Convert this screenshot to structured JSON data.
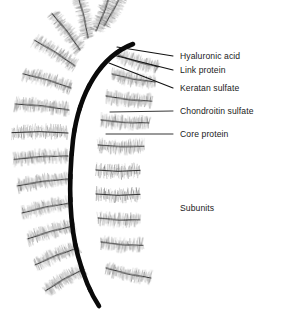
{
  "figure": {
    "width": 282,
    "height": 321,
    "background_color": "#ffffff"
  },
  "colors": {
    "backbone": "#0a0a0a",
    "core_protein": "#2b2b2b",
    "bristle_light": "#b9b9b9",
    "bristle_mid": "#8c8c8c",
    "bristle_dark": "#5a5a5a",
    "leader_line": "#111111",
    "text": "#1a1a1a"
  },
  "labels": [
    {
      "id": "hyaluronic-acid",
      "text": "Hyaluronic acid",
      "x": 180,
      "y": 51,
      "leader": {
        "x1": 173,
        "y1": 56,
        "x2": 117,
        "y2": 47
      }
    },
    {
      "id": "link-protein",
      "text": "Link protein",
      "x": 180,
      "y": 65,
      "leader": {
        "x1": 173,
        "y1": 70,
        "x2": 113,
        "y2": 55
      }
    },
    {
      "id": "keratan-sulfate",
      "text": "Keratan sulfate",
      "x": 180,
      "y": 83,
      "leader": {
        "x1": 173,
        "y1": 88,
        "x2": 109,
        "y2": 63
      }
    },
    {
      "id": "chondroitin-sulfate",
      "text": "Chondroitin sulfate",
      "x": 180,
      "y": 106,
      "leader": {
        "x1": 173,
        "y1": 111,
        "x2": 110,
        "y2": 112
      }
    },
    {
      "id": "core-protein",
      "text": "Core protein",
      "x": 180,
      "y": 129,
      "leader": {
        "x1": 173,
        "y1": 134,
        "x2": 106,
        "y2": 134
      }
    }
  ],
  "annotations": [
    {
      "id": "subunits",
      "text": "Subunits",
      "x": 180,
      "y": 203
    }
  ],
  "structure": {
    "backbone_name": "hyaluronic-acid-backbone",
    "backbone_path": "M 133 44 C 101 56, 79 92, 73 140 C 68 186, 70 226, 78 256 C 85 282, 93 297, 99 306",
    "backbone_width": 4.6,
    "link_protein_count": 12,
    "subunit_count": 21,
    "subunits": [
      {
        "x": 104,
        "y": 26,
        "len": 46,
        "angle": -63,
        "side": "upper"
      },
      {
        "x": 96,
        "y": 31,
        "len": 44,
        "angle": -70,
        "side": "upper"
      },
      {
        "x": 88,
        "y": 38,
        "len": 44,
        "angle": -104,
        "side": "upper"
      },
      {
        "x": 80,
        "y": 50,
        "len": 46,
        "angle": -128,
        "side": "left"
      },
      {
        "x": 75,
        "y": 66,
        "len": 48,
        "angle": -148,
        "side": "left"
      },
      {
        "x": 71,
        "y": 88,
        "len": 50,
        "angle": -164,
        "side": "left"
      },
      {
        "x": 69,
        "y": 110,
        "len": 54,
        "angle": -174,
        "side": "left"
      },
      {
        "x": 68,
        "y": 133,
        "len": 56,
        "angle": -180,
        "side": "left"
      },
      {
        "x": 68,
        "y": 156,
        "len": 54,
        "angle": -184,
        "side": "left"
      },
      {
        "x": 69,
        "y": 179,
        "len": 52,
        "angle": -188,
        "side": "left"
      },
      {
        "x": 71,
        "y": 203,
        "len": 50,
        "angle": -192,
        "side": "left"
      },
      {
        "x": 74,
        "y": 226,
        "len": 48,
        "angle": -196,
        "side": "left"
      },
      {
        "x": 78,
        "y": 248,
        "len": 46,
        "angle": -202,
        "side": "left"
      },
      {
        "x": 84,
        "y": 269,
        "len": 44,
        "angle": -210,
        "side": "left"
      },
      {
        "x": 118,
        "y": 55,
        "len": 42,
        "angle": 16,
        "side": "right"
      },
      {
        "x": 112,
        "y": 74,
        "len": 44,
        "angle": 10,
        "side": "right"
      },
      {
        "x": 106,
        "y": 96,
        "len": 46,
        "angle": 6,
        "side": "right"
      },
      {
        "x": 101,
        "y": 120,
        "len": 48,
        "angle": 3,
        "side": "right"
      },
      {
        "x": 98,
        "y": 145,
        "len": 46,
        "angle": 1,
        "side": "right"
      },
      {
        "x": 96,
        "y": 170,
        "len": 44,
        "angle": 0,
        "side": "right"
      },
      {
        "x": 96,
        "y": 194,
        "len": 44,
        "angle": 0,
        "side": "right"
      },
      {
        "x": 98,
        "y": 218,
        "len": 42,
        "angle": 2,
        "side": "right"
      },
      {
        "x": 101,
        "y": 242,
        "len": 42,
        "angle": 4,
        "side": "right"
      },
      {
        "x": 106,
        "y": 268,
        "len": 46,
        "angle": 12,
        "side": "right"
      }
    ]
  }
}
